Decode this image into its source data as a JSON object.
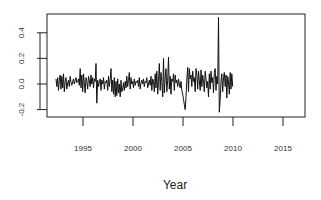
{
  "chart_data": {
    "type": "line",
    "title": "",
    "xlabel": "Year",
    "ylabel": "",
    "xlim": [
      1991.0,
      2017.2
    ],
    "ylim": [
      -0.26,
      0.56
    ],
    "grid": false,
    "legend": null,
    "x_ticks": [
      1995,
      2000,
      2005,
      2010,
      2015
    ],
    "x_tick_labels": [
      "1995",
      "2000",
      "2005",
      "2010",
      "2015"
    ],
    "y_ticks": [
      -0.2,
      0.0,
      0.2,
      0.4
    ],
    "y_tick_labels": [
      "-0.2",
      "0.0",
      "0.2",
      "0.4"
    ],
    "series": [
      {
        "name": "series",
        "color": "#111111",
        "x_start": 1992.3,
        "x_step": 0.08333,
        "values": [
          0.04,
          -0.02,
          0.05,
          -0.05,
          0.03,
          0.07,
          -0.04,
          0.06,
          -0.03,
          0.08,
          -0.06,
          0.02,
          0.05,
          -0.04,
          0.01,
          0.03,
          -0.02,
          0.06,
          0.01,
          -0.01,
          0.02,
          0.04,
          0.0,
          0.03,
          0.05,
          0.01,
          0.02,
          0.04,
          -0.01,
          0.12,
          -0.03,
          0.07,
          -0.06,
          0.08,
          0.01,
          -0.07,
          0.05,
          0.02,
          -0.04,
          0.06,
          0.03,
          -0.02,
          0.07,
          0.0,
          0.05,
          -0.03,
          0.04,
          0.02,
          0.16,
          -0.15,
          0.03,
          -0.02,
          0.01,
          0.04,
          -0.05,
          0.03,
          0.0,
          0.05,
          -0.04,
          0.02,
          0.01,
          0.03,
          -0.05,
          0.06,
          -0.02,
          0.04,
          0.12,
          -0.06,
          0.03,
          -0.08,
          0.05,
          -0.1,
          0.02,
          -0.09,
          0.04,
          -0.07,
          0.0,
          -0.1,
          0.03,
          -0.06,
          -0.04,
          0.01,
          -0.05,
          0.02,
          -0.03,
          0.06,
          -0.02,
          0.03,
          0.09,
          -0.04,
          0.05,
          0.0,
          0.02,
          -0.03,
          0.04,
          -0.01,
          0.02,
          0.01,
          0.03,
          -0.02,
          0.05,
          -0.04,
          0.01,
          0.03,
          0.0,
          0.04,
          -0.02,
          0.02,
          0.01,
          0.05,
          -0.03,
          0.0,
          0.03,
          -0.01,
          0.06,
          -0.05,
          0.04,
          0.02,
          -0.06,
          0.08,
          -0.03,
          0.1,
          -0.08,
          0.02,
          0.16,
          -0.05,
          0.09,
          0.02,
          -0.1,
          0.2,
          -0.07,
          0.05,
          0.12,
          -0.06,
          0.03,
          0.21,
          -0.04,
          0.06,
          -0.08,
          0.04,
          0.02,
          0.08,
          -0.05,
          0.07,
          0.01,
          0.03,
          -0.02,
          0.04,
          0.0,
          -0.03,
          0.02,
          -0.05,
          -0.08,
          -0.12,
          -0.16,
          -0.2,
          -0.1,
          0.03,
          0.13,
          -0.06,
          0.12,
          0.04,
          0.07,
          -0.02,
          0.1,
          0.02,
          0.05,
          -0.06,
          0.12,
          0.08,
          -0.04,
          0.1,
          0.03,
          -0.05,
          0.11,
          -0.02,
          0.07,
          0.02,
          -0.06,
          0.1,
          0.04,
          -0.03,
          0.02,
          -0.1,
          0.08,
          -0.04,
          0.1,
          0.01,
          0.05,
          -0.07,
          0.09,
          0.12,
          -0.05,
          0.06,
          0.0,
          0.52,
          -0.22,
          -0.12,
          0.02,
          0.08,
          -0.06,
          0.05,
          0.09,
          -0.02,
          0.07,
          -0.11,
          0.06,
          0.02,
          -0.08,
          0.09,
          -0.04,
          0.08,
          -0.02
        ]
      }
    ]
  },
  "axes": {
    "x_title": "Year"
  }
}
